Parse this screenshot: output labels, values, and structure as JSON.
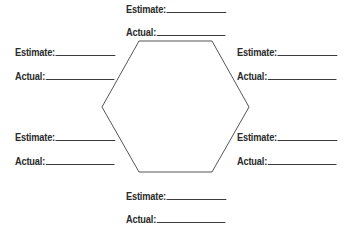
{
  "diagram": {
    "shape": "hexagon",
    "stroke_color": "#555555",
    "vertices": [
      [
        139,
        41
      ],
      [
        212,
        41
      ],
      [
        249,
        107
      ],
      [
        212,
        172
      ],
      [
        139,
        172
      ],
      [
        102,
        107
      ]
    ]
  },
  "fields": {
    "top": {
      "estimate_label": "Estimate:",
      "estimate_value": "",
      "actual_label": "Actual:",
      "actual_value": ""
    },
    "upper_left": {
      "estimate_label": "Estimate:",
      "estimate_value": "",
      "actual_label": "Actual:",
      "actual_value": ""
    },
    "upper_right": {
      "estimate_label": "Estimate:",
      "estimate_value": "",
      "actual_label": "Actual:",
      "actual_value": ""
    },
    "lower_left": {
      "estimate_label": "Estimate:",
      "estimate_value": "",
      "actual_label": "Actual:",
      "actual_value": ""
    },
    "lower_right": {
      "estimate_label": "Estimate:",
      "estimate_value": "",
      "actual_label": "Actual:",
      "actual_value": ""
    },
    "bottom": {
      "estimate_label": "Estimate:",
      "estimate_value": "",
      "actual_label": "Actual:",
      "actual_value": ""
    }
  }
}
